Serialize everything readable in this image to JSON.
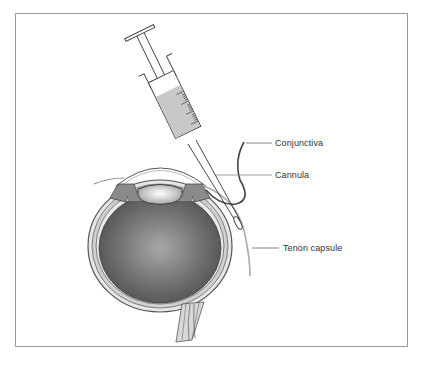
{
  "figure": {
    "labels": {
      "conjunctiva": "Conjunctiva",
      "cannula": "Cannula",
      "tenon_capsule": "Tenon capsule"
    },
    "elements": [
      "syringe",
      "cannula",
      "conjunctiva",
      "tenon-capsule",
      "eyeball",
      "lens",
      "cornea",
      "optic-nerve"
    ],
    "colors": {
      "frame": "#9a9a9a",
      "fluid": "#c8c8c8",
      "globe_dark": "#5a5a5a",
      "globe_light": "#9a9a9a",
      "line": "#3a3a3a"
    }
  }
}
